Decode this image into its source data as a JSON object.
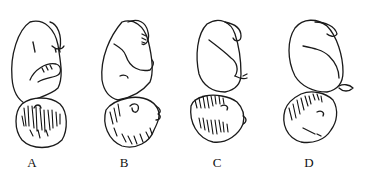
{
  "figure": {
    "panels": [
      {
        "label": "A",
        "head_position": "flexed"
      },
      {
        "label": "B",
        "head_position": "military"
      },
      {
        "label": "C",
        "head_position": "brow"
      },
      {
        "label": "D",
        "head_position": "extended"
      }
    ]
  }
}
